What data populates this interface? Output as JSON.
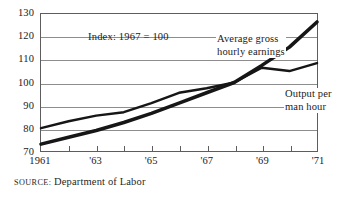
{
  "chart_data": {
    "type": "line",
    "title": "",
    "subtitle": "",
    "xlabel": "",
    "ylabel": "",
    "index_note": "Index: 1967 = 100",
    "grid": true,
    "legend_position": "inline-annotations",
    "xlim": [
      1961,
      1971
    ],
    "ylim": [
      70,
      130
    ],
    "yticks": [
      130,
      120,
      110,
      100,
      90,
      80,
      70
    ],
    "x": [
      1961,
      1962,
      1963,
      1964,
      1965,
      1966,
      1967,
      1968,
      1969,
      1970,
      1971
    ],
    "xtick_labels": [
      "1961",
      "",
      "'63",
      "",
      "'65",
      "",
      "'67",
      "",
      "'69",
      "",
      "'71"
    ],
    "series": [
      {
        "name": "Average gross hourly earnings",
        "values": [
          73.0,
          76.0,
          79.0,
          82.5,
          86.5,
          91.0,
          95.5,
          100.0,
          107.5,
          115.5,
          126.5
        ]
      },
      {
        "name": "Output per man hour",
        "values": [
          80.0,
          83.0,
          85.5,
          87.0,
          91.0,
          95.5,
          97.5,
          100.0,
          106.5,
          105.0,
          108.5
        ]
      }
    ],
    "annotations": [
      {
        "id": "earnings",
        "line1": "Average gross",
        "line2": "hourly earnings"
      },
      {
        "id": "output",
        "line1": "Output per",
        "line2": "man hour"
      }
    ]
  },
  "source": {
    "label": "source:",
    "value": "Department of Labor"
  },
  "colors": {
    "ink": "#161616",
    "grid": "#8d8d8d",
    "frame": "#5d5d5d",
    "background": "#ffffff"
  }
}
